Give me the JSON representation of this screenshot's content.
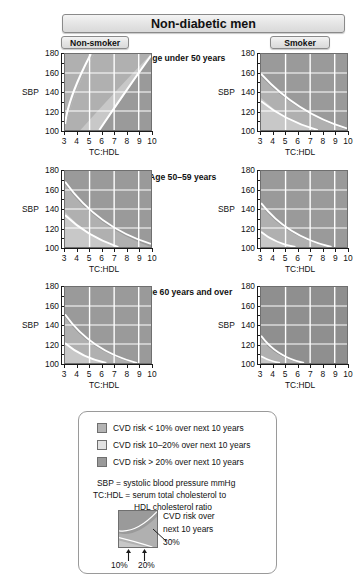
{
  "title": "Non-diabetic men",
  "columns": [
    {
      "id": "non-smoker",
      "label": "Non-smoker"
    },
    {
      "id": "smoker",
      "label": "Smoker"
    }
  ],
  "rows": [
    {
      "id": "age-under-50",
      "label": "Age under 50 years"
    },
    {
      "id": "age-50-59",
      "label": "Age  50–59 years"
    },
    {
      "id": "age-60-over",
      "label": "Age 60 years and over"
    }
  ],
  "axes": {
    "y_title": "SBP",
    "y_ticks": [
      "180",
      "160",
      "140",
      "120",
      "100"
    ],
    "y_min": 100,
    "y_max": 180,
    "x_title": "TC:HDL",
    "x_ticks": [
      "3",
      "4",
      "5",
      "6",
      "7",
      "8",
      "9",
      "10"
    ],
    "x_min": 3,
    "x_max": 10
  },
  "legend": {
    "items": [
      {
        "swatch": "#b4b4b4",
        "text": "CVD risk < 10% over next 10 years"
      },
      {
        "swatch": "#e2e2e2",
        "text": "CVD risk 10–20% over next 10 years"
      },
      {
        "swatch": "#9a9a9a",
        "text": "CVD risk > 20% over next 10 years"
      }
    ],
    "definitions": [
      "SBP = systolic blood pressure mmHg",
      "TC:HDL = serum total cholesterol to",
      "HDL  cholesterol ratio"
    ],
    "mini_caption_line1": "CVD risk over",
    "mini_caption_line2": "next 10 years",
    "mini_label_30": "30%",
    "mini_label_10": "10%",
    "mini_label_20": "20%"
  },
  "colors": {
    "band_low": "#c8c8c8",
    "band_mid": "#b0b0b0",
    "band_high": "#9a9a9a",
    "band_vhigh": "#8f8f8f",
    "gridline": "#ffffff",
    "axis": "#1a1a1a",
    "panel_border": "#6f6f6f"
  },
  "chart_data": {
    "type": "heatmap",
    "title": "Non-diabetic men",
    "xlabel": "TC:HDL",
    "ylabel": "SBP",
    "xlim": [
      3,
      10
    ],
    "ylim": [
      100,
      180
    ],
    "grid": true,
    "legend_position": "bottom",
    "bands": [
      {
        "name": "CVD risk < 10% over next 10 years",
        "color": "#c8c8c8"
      },
      {
        "name": "CVD risk 10–20% over next 10 years",
        "color": "#e2e2e2"
      },
      {
        "name": "CVD risk > 20% over next 10 years",
        "color": "#9a9a9a"
      }
    ],
    "panels": [
      {
        "row": "Age under 50 years",
        "column": "Non-smoker",
        "risk_contours": {
          "10%": "low-left",
          "20%": "mid-diagonal",
          "30%": "upper-right"
        },
        "dominant_band": "low-to-mid"
      },
      {
        "row": "Age under 50 years",
        "column": "Smoker",
        "risk_contours": {
          "10%": "lower-left-corner",
          "20%": "low-diagonal",
          "30%": "mid-diagonal"
        },
        "dominant_band": "high"
      },
      {
        "row": "Age  50–59 years",
        "column": "Non-smoker",
        "risk_contours": {
          "10%": "low-left",
          "20%": "low-diagonal",
          "30%": "mid-diagonal"
        },
        "dominant_band": "mid-to-high"
      },
      {
        "row": "Age  50–59 years",
        "column": "Smoker",
        "risk_contours": {
          "10%": "bottom-left-corner",
          "20%": "lower-left",
          "30%": "low-diagonal"
        },
        "dominant_band": "high"
      },
      {
        "row": "Age 60 years and over",
        "column": "Non-smoker",
        "risk_contours": {
          "10%": "bottom-left-corner",
          "20%": "lower-left",
          "30%": "low-diagonal"
        },
        "dominant_band": "high"
      },
      {
        "row": "Age 60 years and over",
        "column": "Smoker",
        "risk_contours": {
          "10%": "none",
          "20%": "bottom-left-corner",
          "30%": "lower-left"
        },
        "dominant_band": "very-high"
      }
    ]
  }
}
